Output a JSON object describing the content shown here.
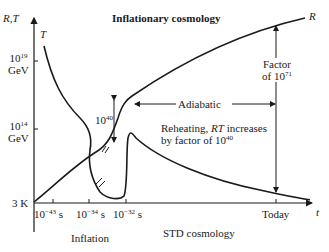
{
  "title": "Inflationary cosmology",
  "axes": {
    "y_label": "R,T",
    "x_label": "t",
    "y_ticks": [
      {
        "base": "10",
        "exp": "19",
        "unit": "GeV"
      },
      {
        "base": "10",
        "exp": "14",
        "unit": "GeV"
      },
      {
        "label": "3 K"
      }
    ],
    "x_ticks": [
      {
        "base": "10",
        "exp": "−43",
        "unit": "s"
      },
      {
        "base": "10",
        "exp": "−34",
        "unit": "s"
      },
      {
        "base": "10",
        "exp": "−32",
        "unit": "s"
      },
      {
        "label": "Today"
      }
    ]
  },
  "curves": {
    "T": "T",
    "R": "R"
  },
  "annotations": {
    "factor_line1": "Factor",
    "factor_line2_prefix": "of 10",
    "factor_exp": "71",
    "jump_base": "10",
    "jump_exp": "40",
    "adiabatic": "Adiabatic",
    "reheat_line1_prefix": "Reheating, ",
    "reheat_rt": "RT",
    "reheat_line1_suffix": " increases",
    "reheat_line2_prefix": "by factor of 10",
    "reheat_exp": "40"
  },
  "bottom_labels": {
    "inflation": "Inflation",
    "std": "STD  cosmology"
  }
}
